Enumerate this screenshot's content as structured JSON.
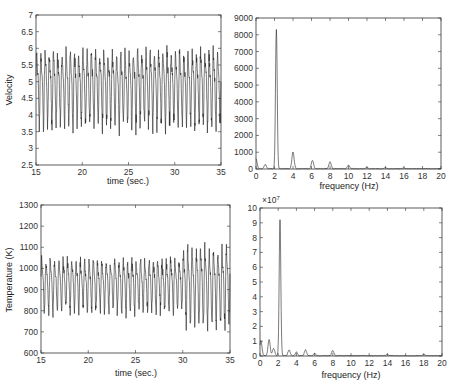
{
  "chart_data": [
    {
      "id": "velocity",
      "type": "line",
      "title": "",
      "xlabel": "time (sec.)",
      "ylabel": "Velocity",
      "xlim": [
        15,
        35
      ],
      "ylim": [
        2.5,
        7
      ],
      "xticks": [
        15,
        20,
        25,
        30,
        35
      ],
      "yticks": [
        2.5,
        3,
        3.5,
        4,
        4.5,
        5,
        5.5,
        6,
        6.5,
        7
      ],
      "ytick_labels": [
        "2.5",
        "3",
        "3.5",
        "4",
        "4.5",
        "5",
        "5.5",
        "6",
        "6.5",
        "7"
      ],
      "grid": false,
      "signal": {
        "dominant_freq_hz": 2.2,
        "mean": 4.9,
        "amplitude": 1.0,
        "min_observed": 2.75,
        "max_observed": 6.8
      },
      "box": {
        "left": 36,
        "top": 15,
        "right": 221,
        "bottom": 165
      }
    },
    {
      "id": "velocity-spectrum",
      "type": "line",
      "title": "",
      "xlabel": "frequency (Hz)",
      "ylabel": "",
      "xlim": [
        0,
        20
      ],
      "ylim": [
        0,
        9000
      ],
      "xticks": [
        0,
        2,
        4,
        6,
        8,
        10,
        12,
        14,
        16,
        18,
        20
      ],
      "yticks": [
        0,
        1000,
        2000,
        3000,
        4000,
        5000,
        6000,
        7000,
        8000,
        9000
      ],
      "ytick_labels": [
        "0",
        "1000",
        "2000",
        "3000",
        "4000",
        "5000",
        "6000",
        "7000",
        "8000",
        "9000"
      ],
      "grid": false,
      "peaks": [
        {
          "f": 0.0,
          "a": 600
        },
        {
          "f": 1.0,
          "a": 250
        },
        {
          "f": 2.2,
          "a": 8300
        },
        {
          "f": 4.0,
          "a": 1000
        },
        {
          "f": 6.1,
          "a": 500
        },
        {
          "f": 8.0,
          "a": 420
        },
        {
          "f": 10.0,
          "a": 220
        },
        {
          "f": 12.0,
          "a": 80
        },
        {
          "f": 14.0,
          "a": 60
        },
        {
          "f": 16.0,
          "a": 50
        }
      ],
      "box": {
        "left": 256,
        "top": 18,
        "right": 441,
        "bottom": 169
      }
    },
    {
      "id": "temperature",
      "type": "line",
      "title": "",
      "xlabel": "time (sec.)",
      "ylabel": "Temperature (K)",
      "xlim": [
        15,
        35
      ],
      "ylim": [
        600,
        1300
      ],
      "xticks": [
        15,
        20,
        25,
        30,
        35
      ],
      "yticks": [
        600,
        700,
        800,
        900,
        1000,
        1100,
        1200,
        1300
      ],
      "ytick_labels": [
        "600",
        "700",
        "800",
        "900",
        "1000",
        "1100",
        "1200",
        "1300"
      ],
      "grid": false,
      "signal": {
        "dominant_freq_hz": 2.2,
        "mean": 930,
        "amplitude": 110,
        "min_observed": 605,
        "max_observed": 1265
      },
      "box": {
        "left": 41,
        "top": 205,
        "right": 230,
        "bottom": 353
      }
    },
    {
      "id": "temperature-spectrum",
      "type": "line",
      "title": "",
      "xlabel": "frequency (Hz)",
      "ylabel": "",
      "xlim": [
        0,
        20
      ],
      "ylim": [
        0,
        10
      ],
      "y_scale_note": "×10^7",
      "xticks": [
        0,
        2,
        4,
        6,
        8,
        10,
        12,
        14,
        16,
        18,
        20
      ],
      "yticks": [
        0,
        1,
        2,
        3,
        4,
        5,
        6,
        7,
        8,
        9,
        10
      ],
      "ytick_labels": [
        "0",
        "1",
        "2",
        "3",
        "4",
        "5",
        "6",
        "7",
        "8",
        "9",
        "10"
      ],
      "grid": false,
      "peaks": [
        {
          "f": 0.1,
          "a": 1.0
        },
        {
          "f": 1.0,
          "a": 1.1
        },
        {
          "f": 1.5,
          "a": 0.5
        },
        {
          "f": 2.2,
          "a": 9.2
        },
        {
          "f": 3.2,
          "a": 0.4
        },
        {
          "f": 4.0,
          "a": 0.25
        },
        {
          "f": 5.0,
          "a": 0.4
        },
        {
          "f": 6.0,
          "a": 0.15
        },
        {
          "f": 8.0,
          "a": 0.35
        },
        {
          "f": 14.0,
          "a": 0.08
        },
        {
          "f": 18.0,
          "a": 0.08
        }
      ],
      "box": {
        "left": 260,
        "top": 208,
        "right": 442,
        "bottom": 356
      }
    }
  ],
  "labels": {
    "velocity_ylabel": "Velocity",
    "velocity_xlabel": "time (sec.)",
    "vspec_xlabel": "frequency (Hz)",
    "temp_ylabel": "Temperature (K)",
    "temp_xlabel": "time (sec.)",
    "tspec_xlabel": "frequency (Hz)",
    "tspec_multiplier": "×10",
    "tspec_exponent": "7"
  }
}
